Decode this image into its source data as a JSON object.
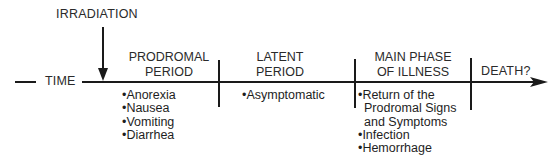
{
  "diagram": {
    "event_label": "IRRADIATION",
    "axis_label": "TIME",
    "phases": [
      {
        "title_lines": [
          "PRODROMAL",
          "PERIOD"
        ],
        "items": [
          "•Anorexia",
          "•Nausea",
          "•Vomiting",
          "•Diarrhea"
        ]
      },
      {
        "title_lines": [
          "LATENT",
          "PERIOD"
        ],
        "items": [
          "•Asymptomatic"
        ]
      },
      {
        "title_lines": [
          "MAIN PHASE",
          "OF ILLNESS"
        ],
        "items": [
          "•Return of the",
          "Prodromal Signs",
          "and Symptoms",
          "•Infection",
          "•Hemorrhage"
        ]
      },
      {
        "title_lines": [
          "DEATH?"
        ],
        "items": []
      }
    ],
    "colors": {
      "line": "#1a1a1a",
      "text": "#2a2a2a",
      "background": "#ffffff"
    }
  }
}
